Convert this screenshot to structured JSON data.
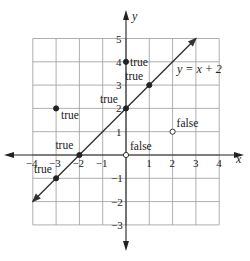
{
  "chart_data": {
    "type": "scatter",
    "title": "",
    "xlabel": "x",
    "ylabel": "y",
    "xlim": [
      -4,
      4
    ],
    "ylim": [
      -3,
      5
    ],
    "grid": true,
    "x_ticks": [
      "-4",
      "-3",
      "-2",
      "-1",
      "1",
      "2",
      "3",
      "4"
    ],
    "y_ticks": [
      "5",
      "4",
      "3",
      "2",
      "1",
      "-1",
      "-2",
      "-3"
    ],
    "line": {
      "equation": "y = x + 2",
      "slope": 1,
      "intercept": 2,
      "arrows": "both"
    },
    "points": [
      {
        "x": 0,
        "y": 4,
        "label": "true",
        "filled": true
      },
      {
        "x": 1,
        "y": 3,
        "label": "true",
        "filled": true
      },
      {
        "x": 0,
        "y": 2,
        "label": "true",
        "filled": true
      },
      {
        "x": -3,
        "y": 2,
        "label": "true",
        "filled": true
      },
      {
        "x": -2,
        "y": 0,
        "label": "true",
        "filled": true
      },
      {
        "x": -3,
        "y": -1,
        "label": "true",
        "filled": true
      },
      {
        "x": 2,
        "y": 1,
        "label": "false",
        "filled": false
      },
      {
        "x": 0,
        "y": 0,
        "label": "false",
        "filled": false
      }
    ]
  },
  "labels": {
    "x_axis": "x",
    "y_axis": "y",
    "equation": "y = x + 2",
    "true_text": "true",
    "false_text": "false"
  }
}
